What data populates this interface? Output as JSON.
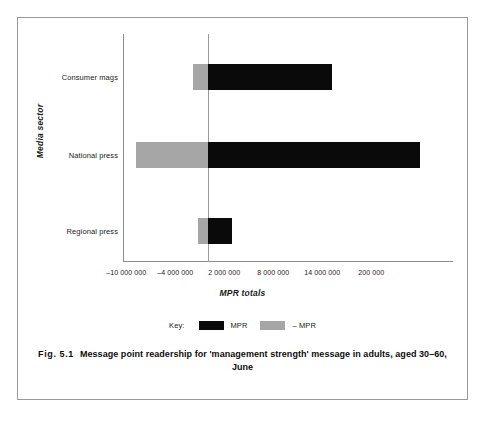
{
  "figure": {
    "caption_number": "Fig. 5.1",
    "caption_text": "Message point readership for 'management strength' message in adults, aged 30–60, June"
  },
  "legend": {
    "key_word": "Key:",
    "items": [
      {
        "label": "MPR",
        "color": "#0a0a0a",
        "swatch": "black-swatch"
      },
      {
        "label": "– MPR",
        "color": "#a6a6a6",
        "swatch": "grey-swatch"
      }
    ]
  },
  "chart_data": {
    "type": "bar",
    "orientation": "horizontal",
    "title": "",
    "xlabel": "MPR totals",
    "ylabel": "Media sector",
    "categories": [
      "Consumer mags",
      "National press",
      "Regional press"
    ],
    "tick_labels": [
      "–10 000 000",
      "–4 000 000",
      "2 000 000",
      "8 000 000",
      "14 000 000",
      "200 000"
    ],
    "tick_values": [
      -10000000,
      -4000000,
      2000000,
      8000000,
      14000000,
      20000000
    ],
    "xlim": [
      -12500000,
      27000000
    ],
    "grid": false,
    "zero_line": true,
    "legend_position": "bottom",
    "series": [
      {
        "name": "MPR",
        "color": "#0a0a0a",
        "values": [
          15200000,
          26000000,
          2900000
        ]
      },
      {
        "name": "– MPR",
        "color": "#a6a6a6",
        "values": [
          -1800000,
          -8800000,
          -1200000
        ]
      }
    ]
  }
}
